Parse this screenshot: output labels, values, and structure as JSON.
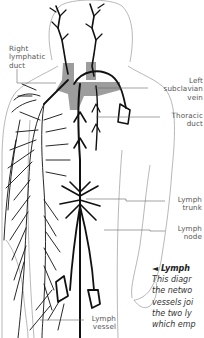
{
  "diagram": {
    "labels": {
      "right_lymphatic_duct": [
        "Right",
        "lymphatic",
        "duct"
      ],
      "left_subclavian_vein": [
        "Left",
        "subclavian",
        "vein"
      ],
      "thoracic_duct": [
        "Thoracic",
        "duct"
      ],
      "lymph_trunk": [
        "Lymph",
        "trunk"
      ],
      "lymph_node": [
        "Lymph",
        "node"
      ],
      "lymph_vessel": [
        "Lymph",
        "vessel"
      ]
    },
    "caption": {
      "title": "◄ Lymph",
      "lines": [
        "This diagr",
        "the netwo",
        "vessels joi",
        "the two ly",
        "which emp"
      ]
    },
    "colors": {
      "vessel": "#111111",
      "outline": "#9a9a9a",
      "vein_shading": "#8c8c8c",
      "label_text": "#555555",
      "leader_line": "#666666"
    }
  }
}
